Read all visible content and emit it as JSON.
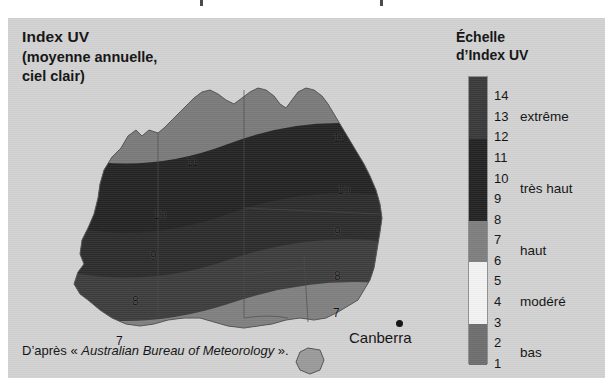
{
  "figure": {
    "title_main": "Index UV",
    "title_sub_line1": "(moyenne annuelle,",
    "title_sub_line2": "ciel clair)",
    "caption_prefix": "D’après « ",
    "caption_source": "Australian Bureau of Meteorology",
    "caption_suffix": " ».",
    "panel_bg": "#d2d2d2"
  },
  "legend": {
    "title_line1": "Échelle",
    "title_line2": "d’Index UV",
    "ticks": [
      "14",
      "13",
      "12",
      "11",
      "10",
      "9",
      "8",
      "7",
      "6",
      "5",
      "4",
      "3",
      "2",
      "1"
    ],
    "categories": [
      {
        "label": "extrême",
        "range": [
          12,
          14
        ]
      },
      {
        "label": "très haut",
        "range": [
          8,
          11
        ]
      },
      {
        "label": "haut",
        "range": [
          6,
          7
        ]
      },
      {
        "label": "modéré",
        "range": [
          3,
          5
        ]
      },
      {
        "label": "bas",
        "range": [
          1,
          2
        ]
      }
    ],
    "bands": [
      {
        "name": "extreme",
        "color": "#3a3a3a",
        "from": 11.5,
        "to": 14.5
      },
      {
        "name": "tres-haut",
        "color": "#232323",
        "from": 7.5,
        "to": 11.5
      },
      {
        "name": "haut",
        "color": "#7e7e7e",
        "from": 5.5,
        "to": 7.5
      },
      {
        "name": "modere",
        "color": "#f2f2f2",
        "from": 2.5,
        "to": 5.5
      },
      {
        "name": "bas",
        "color": "#6e6e6e",
        "from": 0.5,
        "to": 2.5
      }
    ]
  },
  "map": {
    "region": "Australia",
    "city_marker": {
      "name": "Canberra",
      "label": "Canberra"
    },
    "contour_labels": [
      {
        "value": "11",
        "x": 186,
        "y": 143
      },
      {
        "value": "11",
        "x": 333,
        "y": 119
      },
      {
        "value": "10",
        "x": 153,
        "y": 196
      },
      {
        "value": "10",
        "x": 337,
        "y": 171
      },
      {
        "value": "9",
        "x": 148,
        "y": 237
      },
      {
        "value": "9",
        "x": 332,
        "y": 213
      },
      {
        "value": "8",
        "x": 131,
        "y": 282
      },
      {
        "value": "8",
        "x": 332,
        "y": 257
      },
      {
        "value": "7",
        "x": 115,
        "y": 322
      },
      {
        "value": "7",
        "x": 331,
        "y": 294
      }
    ],
    "shading_note": "grayscale UV index bands, darker = higher index"
  },
  "chart_data": {
    "type": "heatmap",
    "title": "Index UV (moyenne annuelle, ciel clair)",
    "subtitle": "Australie",
    "xlabel": "",
    "ylabel": "",
    "legend_title": "Échelle d’Index UV",
    "legend_position": "right",
    "grid": false,
    "zlim": [
      1,
      14
    ],
    "colorbar_ticks": [
      1,
      2,
      3,
      4,
      5,
      6,
      7,
      8,
      9,
      10,
      11,
      12,
      13,
      14
    ],
    "categories": [
      "bas",
      "modéré",
      "haut",
      "très haut",
      "extrême"
    ],
    "category_ranges": [
      [
        1,
        2
      ],
      [
        3,
        5
      ],
      [
        6,
        7
      ],
      [
        8,
        11
      ],
      [
        12,
        14
      ]
    ],
    "category_colors": [
      "#6e6e6e",
      "#f2f2f2",
      "#7e7e7e",
      "#232323",
      "#3a3a3a"
    ],
    "contour_levels": [
      7,
      8,
      9,
      10,
      11
    ],
    "annotations": [
      {
        "text": "Canberra",
        "value": 7
      },
      {
        "text": "D’après « Australian Bureau of Meteorology »."
      }
    ],
    "series": [
      {
        "name": "UV index isoline",
        "value": 11,
        "description": "northern Australia / tropics"
      },
      {
        "name": "UV index isoline",
        "value": 10,
        "description": "central-north"
      },
      {
        "name": "UV index isoline",
        "value": 9,
        "description": "central"
      },
      {
        "name": "UV index isoline",
        "value": 8,
        "description": "central-south"
      },
      {
        "name": "UV index isoline",
        "value": 7,
        "description": "southern Australia, Canberra region"
      }
    ]
  }
}
